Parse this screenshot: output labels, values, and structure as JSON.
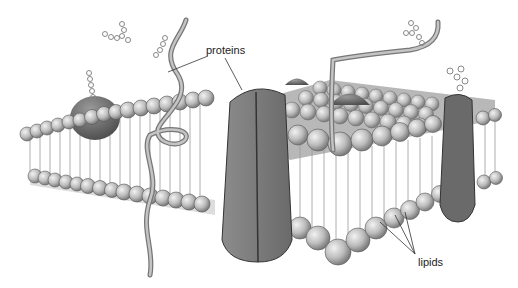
{
  "diagram": {
    "labels": {
      "proteins": "proteins",
      "lipids": "lipids"
    },
    "colors": {
      "background": "#ffffff",
      "lipid_head": "#c8c8c8",
      "lipid_head_shadow": "#8a8a8a",
      "protein": "#7a7a7a",
      "protein_dark": "#5a5a5a",
      "tail": "#9a9a9a",
      "outline": "#333333"
    }
  }
}
